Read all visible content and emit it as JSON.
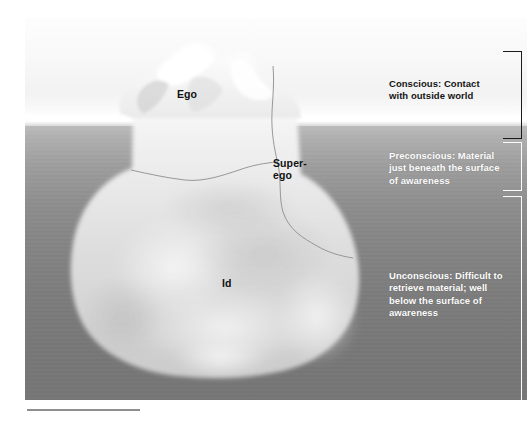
{
  "figure": {
    "berg_labels": [
      {
        "id": "ego",
        "text": "Ego"
      },
      {
        "id": "superego",
        "text": "Super-\nego"
      },
      {
        "id": "id",
        "text": "Id"
      }
    ],
    "annotations": [
      {
        "id": "conscious",
        "text": "Conscious: Contact\nwith outside world",
        "color": "#141414",
        "bracket_color": "#1b1b1b"
      },
      {
        "id": "preconscious",
        "text": "Preconscious: Material\njust beneath the surface\nof awareness",
        "color": "#fdfdfd",
        "bracket_color": "#fbfbfb"
      },
      {
        "id": "unconscious",
        "text": "Unconscious: Difficult to\nretrieve material; well\nbelow the surface of\nawareness",
        "color": "#fdfdfd",
        "bracket_color": "#fbfbfb"
      }
    ],
    "palette": {
      "sky": "#fafafa",
      "water_top": "#c2c2c2",
      "water_bottom": "#767676",
      "iceberg_above": "#f4f4f4",
      "iceberg_below": "#cfcfcf",
      "caption_rule": "#8e8e8e"
    }
  }
}
